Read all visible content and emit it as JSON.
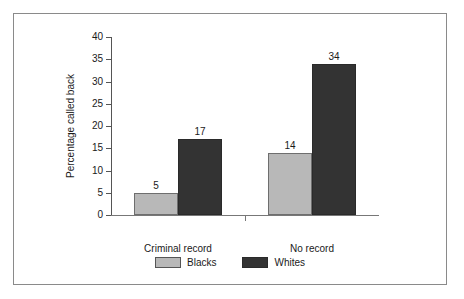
{
  "chart_data": {
    "type": "bar",
    "title": "",
    "subtitle": "",
    "xlabel": "",
    "ylabel": "Percentage called back",
    "categories": [
      "Criminal record",
      "No record"
    ],
    "series": [
      {
        "name": "Blacks",
        "values": [
          5,
          17
        ],
        "color": "#b8b8b8"
      },
      {
        "name": "Whites",
        "values": [
          17,
          34
        ],
        "color": "#333333"
      }
    ],
    "bars": [
      {
        "category": "Criminal record",
        "series": "Blacks",
        "value": 5,
        "label": "5",
        "color": "#b8b8b8"
      },
      {
        "category": "Criminal record",
        "series": "Whites",
        "value": 17,
        "label": "17",
        "color": "#333333"
      },
      {
        "category": "No record",
        "series": "Blacks",
        "value": 14,
        "label": "14",
        "color": "#b8b8b8"
      },
      {
        "category": "No record",
        "series": "Whites",
        "value": 34,
        "label": "34",
        "color": "#333333"
      }
    ],
    "ylim": [
      0,
      40
    ],
    "ytick_step": 5,
    "ytick_labels": [
      "0",
      "5",
      "10",
      "15",
      "20",
      "25",
      "30",
      "35",
      "40"
    ],
    "grid": false,
    "legend_position": "bottom",
    "legend": [
      {
        "label": "Blacks",
        "color": "#b8b8b8"
      },
      {
        "label": "Whites",
        "color": "#333333"
      }
    ]
  },
  "colors": {
    "blacks_series": "#b8b8b8",
    "whites_series": "#333333",
    "axis": "#555555",
    "frame_border": "#8a8a8a",
    "background": "#ffffff"
  }
}
